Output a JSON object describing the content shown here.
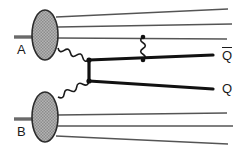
{
  "figure": {
    "kind": "feynman-diagram",
    "background_color": "#ffffff",
    "line_color": "#1a1a1a",
    "spectator_line_color": "#555555",
    "blob_fill_color": "#a8a8a8",
    "blob_edge_color": "#2b2b2b",
    "width": 251,
    "height": 152
  },
  "labels": {
    "hadron_a": "A",
    "hadron_b": "B",
    "antiquark": "Q",
    "antiquark_bar": "̅",
    "quark": "Q"
  },
  "nodes": {
    "blob_a": {
      "name": "hadron-a-blob",
      "cx": 45,
      "cy": 35,
      "rx": 13,
      "ry": 25
    },
    "blob_b": {
      "name": "hadron-b-blob",
      "cx": 45,
      "cy": 117,
      "rx": 13,
      "ry": 25
    },
    "vertex_top": {
      "name": "upper-production-vertex",
      "x": 89,
      "y": 60
    },
    "vertex_bottom": {
      "name": "lower-production-vertex",
      "x": 89,
      "y": 81
    },
    "gluon_emit_top": {
      "name": "gluon-emission-point-top",
      "x": 143,
      "y": 37
    },
    "gluon_absorb": {
      "name": "gluon-absorption-point",
      "x": 143,
      "y": 60
    }
  },
  "lines": {
    "incoming_a": {
      "name": "incoming-hadron-a",
      "x1": 14,
      "y1": 37,
      "x2": 34,
      "y2": 37
    },
    "incoming_b": {
      "name": "incoming-hadron-b",
      "x1": 14,
      "y1": 119,
      "x2": 34,
      "y2": 119
    },
    "spectators_a": [
      {
        "x1": 56,
        "y1": 17,
        "x2": 228,
        "y2": 9
      },
      {
        "x1": 58,
        "y1": 27,
        "x2": 232,
        "y2": 24
      },
      {
        "x1": 57,
        "y1": 38,
        "x2": 227,
        "y2": 39
      }
    ],
    "spectators_b": [
      {
        "x1": 57,
        "y1": 115,
        "x2": 227,
        "y2": 113
      },
      {
        "x1": 58,
        "y1": 126,
        "x2": 233,
        "y2": 126
      },
      {
        "x1": 56,
        "y1": 136,
        "x2": 228,
        "y2": 144
      }
    ],
    "antiquark_out": {
      "name": "antiquark-outgoing-line",
      "x1": 89,
      "y1": 60,
      "x2": 213,
      "y2": 55
    },
    "quark_out": {
      "name": "quark-outgoing-line",
      "x1": 89,
      "y1": 81,
      "x2": 213,
      "y2": 89
    },
    "hard_propagator": {
      "name": "heavy-quark-propagator",
      "x1": 89,
      "y1": 60,
      "x2": 89,
      "y2": 81
    }
  },
  "gluons": [
    {
      "name": "gluon-from-hadron-a",
      "x1": 58,
      "y1": 48,
      "x2": 89,
      "y2": 60,
      "amplitude": 3.2,
      "wavelength": 6.5
    },
    {
      "name": "gluon-from-hadron-b",
      "x1": 58,
      "y1": 97,
      "x2": 89,
      "y2": 81,
      "amplitude": 3.2,
      "wavelength": 6.5
    },
    {
      "name": "gluon-final-state-radiation",
      "x1": 143,
      "y1": 37,
      "x2": 143,
      "y2": 60,
      "amplitude": 3.0,
      "wavelength": 6.0
    }
  ],
  "label_positions": {
    "hadron_a": {
      "x": 17,
      "y": 43
    },
    "hadron_b": {
      "x": 17,
      "y": 125
    },
    "antiquark": {
      "x": 222,
      "y": 47
    },
    "quark": {
      "x": 222,
      "y": 82
    }
  }
}
